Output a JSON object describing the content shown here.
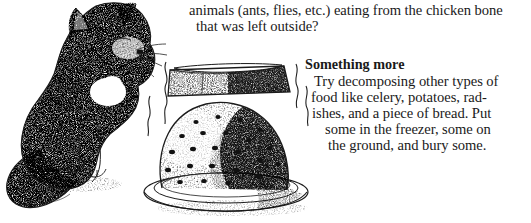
{
  "page": {
    "background_color": "#ffffff",
    "text_color": "#1a1a1a",
    "width": 531,
    "height": 223
  },
  "body_text": {
    "question_line_1": "animals (ants, flies, etc.) eating from the chicken bone",
    "question_line_2": "that was left outside?"
  },
  "section": {
    "heading": "Something more",
    "line_1": "Try decomposing other types of",
    "line_2": "food like celery, potatoes, rad-",
    "line_3": "ishes, and a piece of bread. Put",
    "line_4": "some in the freezer, some on",
    "line_5": "the ground, and bury some."
  },
  "illustration": {
    "caption_absent": true,
    "elements": [
      "cat",
      "colander",
      "brick",
      "plate",
      "odor-squiggles"
    ],
    "ink_color": "#1b1b1b",
    "style": "stipple-engraving"
  }
}
